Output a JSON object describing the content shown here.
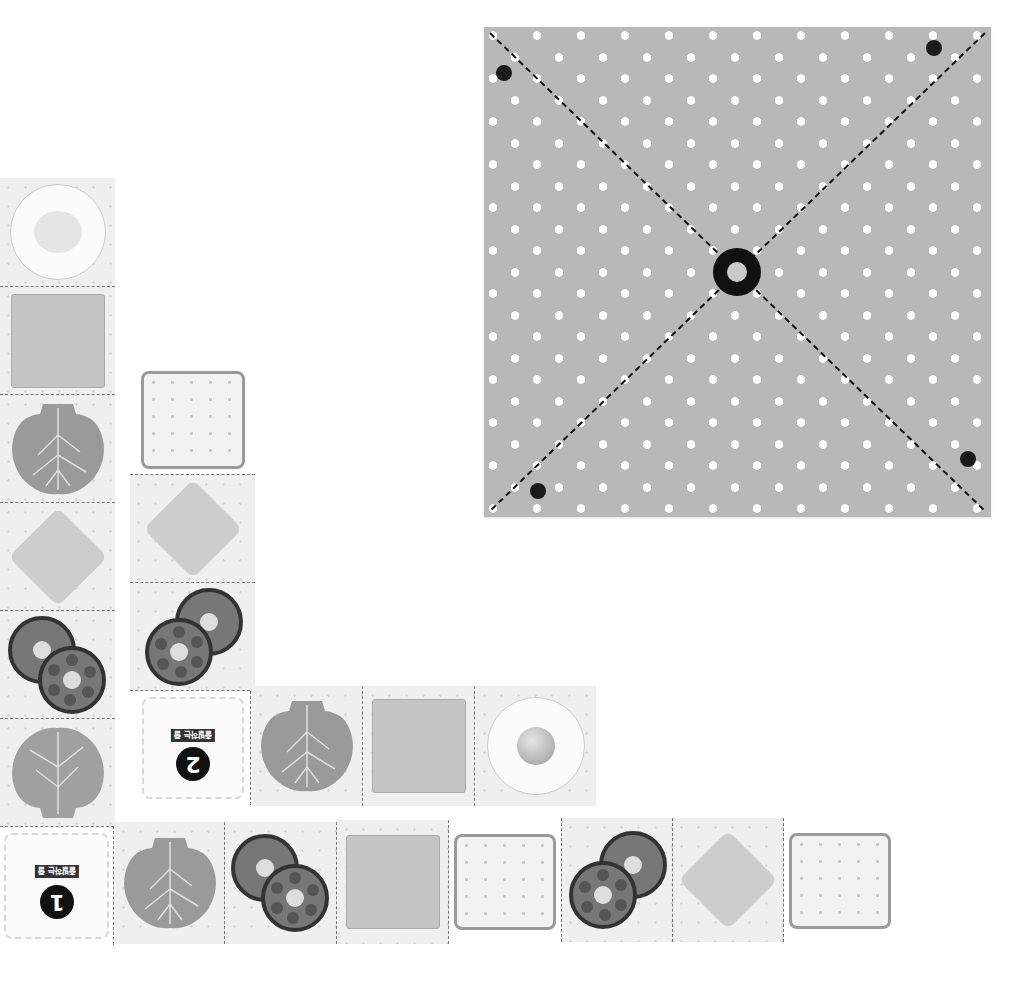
{
  "board": {
    "name": "pegboard",
    "color": "#b8b8b8",
    "dot_color": "#ffffff",
    "pegs": [
      {
        "x": 504,
        "y": 73
      },
      {
        "x": 934,
        "y": 48
      },
      {
        "x": 968,
        "y": 459
      },
      {
        "x": 538,
        "y": 491
      }
    ],
    "hub": {
      "x": 737,
      "y": 272
    }
  },
  "cards": [
    {
      "number": "1",
      "label": "출발하는 줄"
    },
    {
      "number": "2",
      "label": "출발하는 줄"
    }
  ],
  "path1": {
    "vertical": [
      "egg",
      "cheese",
      "lettuce",
      "ham",
      "tomato",
      "lettuce"
    ],
    "horizontal": [
      "card-1",
      "lettuce",
      "tomato",
      "cheese",
      "bread",
      "tomato",
      "ham",
      "bread"
    ]
  },
  "path2": {
    "vertical": [
      "bread",
      "ham",
      "tomato"
    ],
    "horizontal": [
      "card-2",
      "lettuce",
      "cheese",
      "egg"
    ]
  }
}
